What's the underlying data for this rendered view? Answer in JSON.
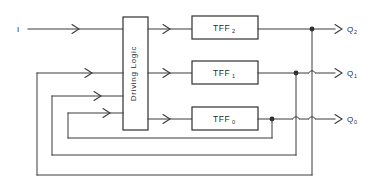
{
  "figure": {
    "background_color": "#ffffff",
    "line_color": "#3b3b3b",
    "text_color": "#2a2a2a"
  },
  "input": {
    "label": "I",
    "name": "input-signal"
  },
  "driving_logic": {
    "label": "Driving Logic",
    "orientation": "vertical"
  },
  "flipflops": [
    {
      "base": "TFF",
      "subscript": "2",
      "row": "top"
    },
    {
      "base": "TFF",
      "subscript": "1",
      "row": "middle"
    },
    {
      "base": "TFF",
      "subscript": "0",
      "row": "bottom"
    }
  ],
  "outputs": [
    {
      "base": "Q",
      "subscript": "2",
      "row": "top"
    },
    {
      "base": "Q",
      "subscript": "1",
      "row": "middle"
    },
    {
      "base": "Q",
      "subscript": "0",
      "row": "bottom"
    }
  ],
  "feedback": {
    "count": 3,
    "description": "Three feedback paths route output taps back to the driving logic inputs"
  }
}
